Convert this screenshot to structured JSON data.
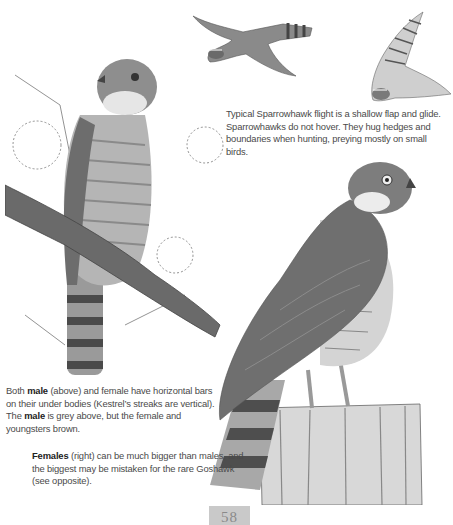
{
  "page": {
    "number": "58",
    "background": "#ffffff"
  },
  "captions": {
    "flight": {
      "text": "Typical Sparrowhawk flight is a shallow flap and glide. Sparrowhawks do not hover. They hug hedges and boundaries when hunting, preying mostly on small birds."
    },
    "male": {
      "part1": "Both ",
      "bold1": "male",
      "part2": " (above) and female have horizontal bars on their under bodies (Kestrel’s streaks are vertical). The ",
      "bold2": "male",
      "part3": " is grey above, but the female and youngsters brown."
    },
    "female": {
      "bold1": "Females",
      "part1": " (right) can be much bigger than males, and the biggest may be mistaken for the rare Goshawk (see opposite)."
    }
  },
  "illustrations": {
    "flight_bird_1": "sparrowhawk-flying-side-view",
    "flight_bird_2": "sparrowhawk-flying-underside-view",
    "male_perched": "male-sparrowhawk-on-pine-branch",
    "female_perched": "female-sparrowhawk-on-fence-post"
  },
  "colors": {
    "text": "#4a4a4a",
    "bold_text": "#222222",
    "page_number_box": "#c9c9c9"
  }
}
